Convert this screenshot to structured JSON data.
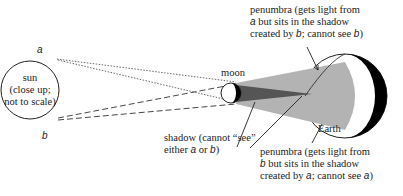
{
  "diagram": {
    "point_a": "a",
    "point_b": "b",
    "sun": {
      "line1": "sun",
      "line2": "(close up;",
      "line3": "not to scale)"
    },
    "moon": "moon",
    "earth": "Earth",
    "penumbra_top": {
      "line1": "penumbra (gets light from",
      "line2_pre": "",
      "line2_var": "a",
      "line2_post": " but sits in the shadow",
      "line3_pre": "created by ",
      "line3_var1": "b",
      "line3_mid": "; cannot see ",
      "line3_var2": "b",
      "line3_post": ")"
    },
    "shadow": {
      "line1": "shadow (cannot “see”",
      "line2_pre": "either ",
      "line2_var1": "a",
      "line2_mid": " or ",
      "line2_var2": "b",
      "line2_post": ")"
    },
    "penumbra_bottom": {
      "line1": "penumbra (gets light from",
      "line2_var": "b",
      "line2_post": " but sits in the shadow",
      "line3_pre": "created by ",
      "line3_var1": "a",
      "line3_mid": "; cannot see ",
      "line3_var2": "a",
      "line3_post": ")"
    },
    "colors": {
      "penumbra_fill": "#b3b3b3",
      "umbra_fill": "#555555",
      "earth_night": "#000000",
      "line": "#222222"
    }
  }
}
